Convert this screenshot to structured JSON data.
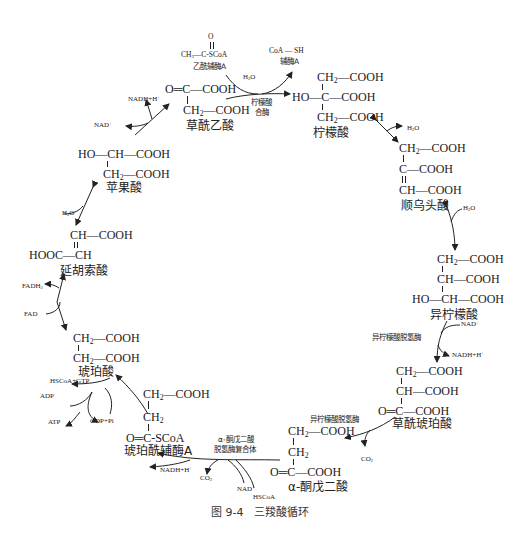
{
  "caption": "图 9-4　三羧酸循环",
  "molecules": {
    "acetyl_coa": {
      "name": "乙酰辅酶A",
      "o": "O",
      "formula_left": "CH",
      "formula_left_sub": "3",
      "formula_right": "C-SCoA"
    },
    "coa_sh": {
      "formula": "CoA — SH",
      "name": "辅酶A"
    },
    "oxaloacetate": {
      "name": "草酰乙酸",
      "line1": "O═C—COOH",
      "line2a": "CH",
      "line2b": "—COOH"
    },
    "citrate": {
      "name": "柠檬酸",
      "line1a": "CH",
      "line1b": "—COOH",
      "line2": "HO—C—COOH",
      "line3a": "CH",
      "line3b": "—COOH"
    },
    "cis_aconitate": {
      "name": "顺乌头酸",
      "line1a": "CH",
      "line1b": "—COOH",
      "line2": "C—COOH",
      "line3": "CH—COOH"
    },
    "isocitrate": {
      "name": "异柠檬酸",
      "line1a": "CH",
      "line1b": "—COOH",
      "line2": "CH—COOH",
      "line3": "HO—CH—COOH"
    },
    "oxalosuccinate": {
      "name": "草酰琥珀酸",
      "line1a": "CH",
      "line1b": "—COOH",
      "line2": "CH—COOH",
      "line3": "O═C—COOH"
    },
    "alpha_ketoglutarate": {
      "name": "α-酮戊二酸",
      "line1a": "CH",
      "line1b": "—COOH",
      "line2": "CH",
      "line3": "O═C—COOH"
    },
    "succinyl_coa": {
      "name": "琥珀酰辅酶A",
      "line1a": "CH",
      "line1b": "—COOH",
      "line2": "CH",
      "line3": "O═C-SCoA"
    },
    "succinate": {
      "name": "琥珀酸",
      "line1a": "CH",
      "line1b": "—COOH",
      "line2a": "CH",
      "line2b": "—COOH"
    },
    "fumarate": {
      "name": "延胡索酸",
      "line1": "CH—COOH",
      "line2": "HOOC—CH"
    },
    "malate": {
      "name": "苹果酸",
      "line1": "HO—CH—COOH",
      "line2a": "CH",
      "line2b": "—COOH"
    }
  },
  "enzymes": {
    "citrate_synthase_1": "柠檬酸",
    "citrate_synthase_2": "合酶",
    "isocitrate_dh_1": "异柠檬酸脱氢酶",
    "isocitrate_dh_2": "异柠檬酸脱氢酶",
    "akgdh_1": "α-酮戊二酸",
    "akgdh_2": "脱氢酶复合体"
  },
  "cofactors": {
    "h2o_citrate": "H2O",
    "h2o_aconitase_1": "H2O",
    "h2o_aconitase_2": "H2O",
    "nad_isocitrate": "NAD+",
    "nadh_isocitrate": "NADH+H+",
    "co2_isocitrate": "CO2",
    "nad_akg": "NAD+",
    "hscoa_akg": "HSCoA",
    "co2_akg": "CO2",
    "nadh_akg": "NADH+H+",
    "hscoa_gtp": "HSCoA+GTP",
    "gdp_pi": "GDP+Pi",
    "adp": "ADP",
    "atp": "ATP",
    "fad": "FAD",
    "fadh2": "FADH2",
    "h2o_fumarase": "H2O",
    "nad_malate": "NAD+",
    "nadh_malate": "NADH+H+"
  }
}
